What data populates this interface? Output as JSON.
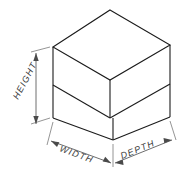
{
  "figure": {
    "kind": "isometric-technical-drawing",
    "background_color": "#ffffff",
    "line_color": "#1b1b1b",
    "dimension_color": "#5d5d5d",
    "text_color": "#3a3a3a"
  },
  "labels": {
    "height": "HEIGHT",
    "width": "WIDTH",
    "depth": "DEPTH"
  },
  "dimensions": {
    "height": {
      "label": "HEIGHT",
      "orientation": "vertical",
      "rotation_deg": -62,
      "arrows": "both-ends"
    },
    "width": {
      "label": "WIDTH",
      "orientation": "iso-left",
      "rotation_deg": 30,
      "arrows": "both-ends"
    },
    "depth": {
      "label": "DEPTH",
      "orientation": "iso-right",
      "rotation_deg": -30,
      "arrows": "both-ends"
    }
  },
  "geometry": {
    "top_face": "110,10 170,46 110,82 53,47",
    "back_wall_front_face": "53,47 110,82 110,120 53,84",
    "seat_top_face": "110,82 170,46 170,84 113,118",
    "front_face_lower": "113,118 170,84 170,117 113,140",
    "left_face_lower": "53,84 113,118 113,140 53,118"
  }
}
